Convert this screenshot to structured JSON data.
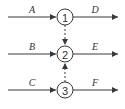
{
  "diagram": {
    "type": "flow-network",
    "nodes": [
      {
        "id": "1",
        "label": "1"
      },
      {
        "id": "2",
        "label": "2"
      },
      {
        "id": "3",
        "label": "3"
      }
    ],
    "inputs": [
      {
        "label": "A",
        "to": "1"
      },
      {
        "label": "B",
        "to": "2"
      },
      {
        "label": "C",
        "to": "3"
      }
    ],
    "outputs": [
      {
        "label": "D",
        "from": "1"
      },
      {
        "label": "E",
        "from": "2"
      },
      {
        "label": "F",
        "from": "3"
      }
    ],
    "dependencies": [
      {
        "from": "1",
        "to": "2",
        "style": "dashed"
      },
      {
        "from": "3",
        "to": "2",
        "style": "dashed"
      }
    ]
  }
}
